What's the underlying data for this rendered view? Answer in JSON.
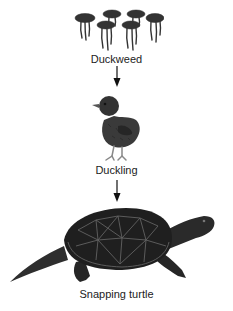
{
  "diagram": {
    "type": "food-chain",
    "direction": "top-to-bottom",
    "nodes": [
      {
        "id": "duckweed",
        "label": "Duckweed",
        "icon": "duckweed-icon"
      },
      {
        "id": "duckling",
        "label": "Duckling",
        "icon": "duckling-icon"
      },
      {
        "id": "snapping-turtle",
        "label": "Snapping turtle",
        "icon": "snapping-turtle-icon"
      }
    ],
    "edges": [
      {
        "from": "duckweed",
        "to": "duckling"
      },
      {
        "from": "duckling",
        "to": "snapping-turtle"
      }
    ]
  },
  "colors": {
    "background": "#ffffff",
    "ink": "#222222",
    "organism_dark": "#2b2b2b",
    "organism_mid": "#555555"
  }
}
